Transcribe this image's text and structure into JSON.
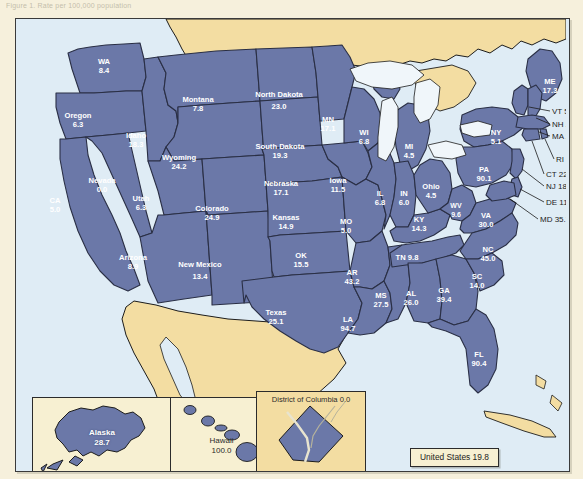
{
  "caption": "Figure 1. Rate per 100,000 population",
  "map": {
    "title_box": "United States 19.8",
    "states": [
      {
        "code": "WA",
        "label": "WA",
        "value": "8.4",
        "x": 88,
        "y": 48
      },
      {
        "code": "OR",
        "label": "Oregon",
        "value": "6.3",
        "x": 62,
        "y": 102
      },
      {
        "code": "CA",
        "label": "CA",
        "value": "5.0",
        "x": 39,
        "y": 187
      },
      {
        "code": "NV",
        "label": "Nevada",
        "value": "0.0",
        "x": 86,
        "y": 167
      },
      {
        "code": "ID",
        "label": "Idaho",
        "value": "18.3",
        "x": 120,
        "y": 122
      },
      {
        "code": "MT",
        "label": "Montana",
        "value": "7.8",
        "x": 182,
        "y": 86
      },
      {
        "code": "WY",
        "label": "Wyoming",
        "value": "24.2",
        "x": 163,
        "y": 144
      },
      {
        "code": "UT",
        "label": "Utah",
        "value": "6.3",
        "x": 125,
        "y": 185
      },
      {
        "code": "AZ",
        "label": "Arizona",
        "value": "8.9",
        "x": 117,
        "y": 244
      },
      {
        "code": "CO",
        "label": "Colorado",
        "value": "24.9",
        "x": 196,
        "y": 195
      },
      {
        "code": "NM",
        "label": "New Mexico",
        "value": "13.4",
        "x": 184,
        "y": 254
      },
      {
        "code": "ND",
        "label": "North Dakota",
        "value": "23.0",
        "x": 263,
        "y": 84
      },
      {
        "code": "SD",
        "label": "South Dakota",
        "value": "19.3",
        "x": 264,
        "y": 133
      },
      {
        "code": "NE",
        "label": "Nebraska",
        "value": "17.1",
        "x": 265,
        "y": 170
      },
      {
        "code": "KS",
        "label": "Kansas",
        "value": "14.9",
        "x": 270,
        "y": 204
      },
      {
        "code": "OK",
        "label": "OK",
        "value": "15.5",
        "x": 285,
        "y": 242
      },
      {
        "code": "TX",
        "label": "Texas",
        "value": "25.1",
        "x": 260,
        "y": 299
      },
      {
        "code": "MN",
        "label": "MN",
        "value": "17.1",
        "x": 312,
        "y": 106
      },
      {
        "code": "IA",
        "label": "Iowa",
        "value": "11.5",
        "x": 322,
        "y": 167
      },
      {
        "code": "MO",
        "label": "MO",
        "value": "5.0",
        "x": 330,
        "y": 208
      },
      {
        "code": "AR",
        "label": "AR",
        "value": "43.2",
        "x": 336,
        "y": 259
      },
      {
        "code": "LA",
        "label": "LA",
        "value": "94.7",
        "x": 332,
        "y": 306
      },
      {
        "code": "WI",
        "label": "WI",
        "value": "6.8",
        "x": 348,
        "y": 119
      },
      {
        "code": "IL",
        "label": "IL",
        "value": "6.8",
        "x": 364,
        "y": 180
      },
      {
        "code": "MS",
        "label": "MS",
        "value": "27.5",
        "x": 365,
        "y": 282
      },
      {
        "code": "MI",
        "label": "MI",
        "value": "4.5",
        "x": 393,
        "y": 133
      },
      {
        "code": "IN",
        "label": "IN",
        "value": "6.0",
        "x": 388,
        "y": 180
      },
      {
        "code": "KY",
        "label": "KY",
        "value": "14.3",
        "x": 403,
        "y": 206
      },
      {
        "code": "TN",
        "label": "TN 9.8",
        "value": "",
        "x": 391,
        "y": 241
      },
      {
        "code": "AL",
        "label": "AL",
        "value": "26.0",
        "x": 395,
        "y": 280
      },
      {
        "code": "OH",
        "label": "Ohio",
        "value": "4.5",
        "x": 415,
        "y": 173
      },
      {
        "code": "GA",
        "label": "GA",
        "value": "39.4",
        "x": 428,
        "y": 277
      },
      {
        "code": "WV",
        "label": "WV",
        "value": "9.6",
        "x": 440,
        "y": 192
      },
      {
        "code": "VA",
        "label": "VA",
        "value": "30.0",
        "x": 470,
        "y": 202
      },
      {
        "code": "NC",
        "label": "NC",
        "value": "45.0",
        "x": 472,
        "y": 236
      },
      {
        "code": "SC",
        "label": "SC",
        "value": "14.0",
        "x": 461,
        "y": 263
      },
      {
        "code": "FL",
        "label": "FL",
        "value": "90.4",
        "x": 463,
        "y": 341
      },
      {
        "code": "NY",
        "label": "NY",
        "value": "5.1",
        "x": 480,
        "y": 119
      },
      {
        "code": "PA",
        "label": "PA",
        "value": "90.1",
        "x": 468,
        "y": 156
      },
      {
        "code": "ME",
        "label": "ME",
        "value": "17.3",
        "x": 534,
        "y": 68
      }
    ],
    "callouts": [
      {
        "code": "VT",
        "text": "VT 51.4",
        "tx": 536,
        "ty": 95,
        "lx1": 534,
        "ly1": 92,
        "lx2": 513,
        "ly2": 88
      },
      {
        "code": "NH",
        "text": "NH 2.8",
        "tx": 536,
        "ty": 108,
        "lx1": 534,
        "ly1": 105,
        "lx2": 520,
        "ly2": 99
      },
      {
        "code": "MA",
        "text": "MA 26.8",
        "tx": 536,
        "ty": 120,
        "lx1": 534,
        "ly1": 117,
        "lx2": 523,
        "ly2": 113
      },
      {
        "code": "RI",
        "text": "RI 6.9",
        "tx": 540,
        "ty": 143,
        "lx1": 538,
        "ly1": 140,
        "lx2": 525,
        "ly2": 128
      },
      {
        "code": "CT",
        "text": "CT 22.1",
        "tx": 530,
        "ty": 158,
        "lx1": 528,
        "ly1": 155,
        "lx2": 517,
        "ly2": 133
      },
      {
        "code": "NJ",
        "text": "NJ 18.0",
        "tx": 530,
        "ty": 170,
        "lx1": 528,
        "ly1": 167,
        "lx2": 505,
        "ly2": 152
      },
      {
        "code": "DE",
        "text": "DE 11.8",
        "tx": 530,
        "ty": 186,
        "lx1": 528,
        "ly1": 183,
        "lx2": 502,
        "ly2": 175
      },
      {
        "code": "MD",
        "text": "MD 35.7",
        "tx": 524,
        "ty": 203,
        "lx1": 522,
        "ly1": 200,
        "lx2": 497,
        "ly2": 186
      }
    ]
  },
  "insets": {
    "alaska": {
      "name": "Alaska",
      "value": "28.7"
    },
    "hawaii": {
      "name": "Hawaii",
      "value": "100.0"
    },
    "dc": {
      "label": "District of Columbia 0.0"
    }
  },
  "colors": {
    "state_fill": "#6b78a8",
    "state_stroke": "#2a2f45",
    "water": "#dfecf5",
    "foreign_land": "#f3dda2",
    "page_background": "#f6f0dc",
    "inset_background": "#f7f0d2",
    "label_text": "#ffffff",
    "callout_text": "#1c1c1c"
  }
}
